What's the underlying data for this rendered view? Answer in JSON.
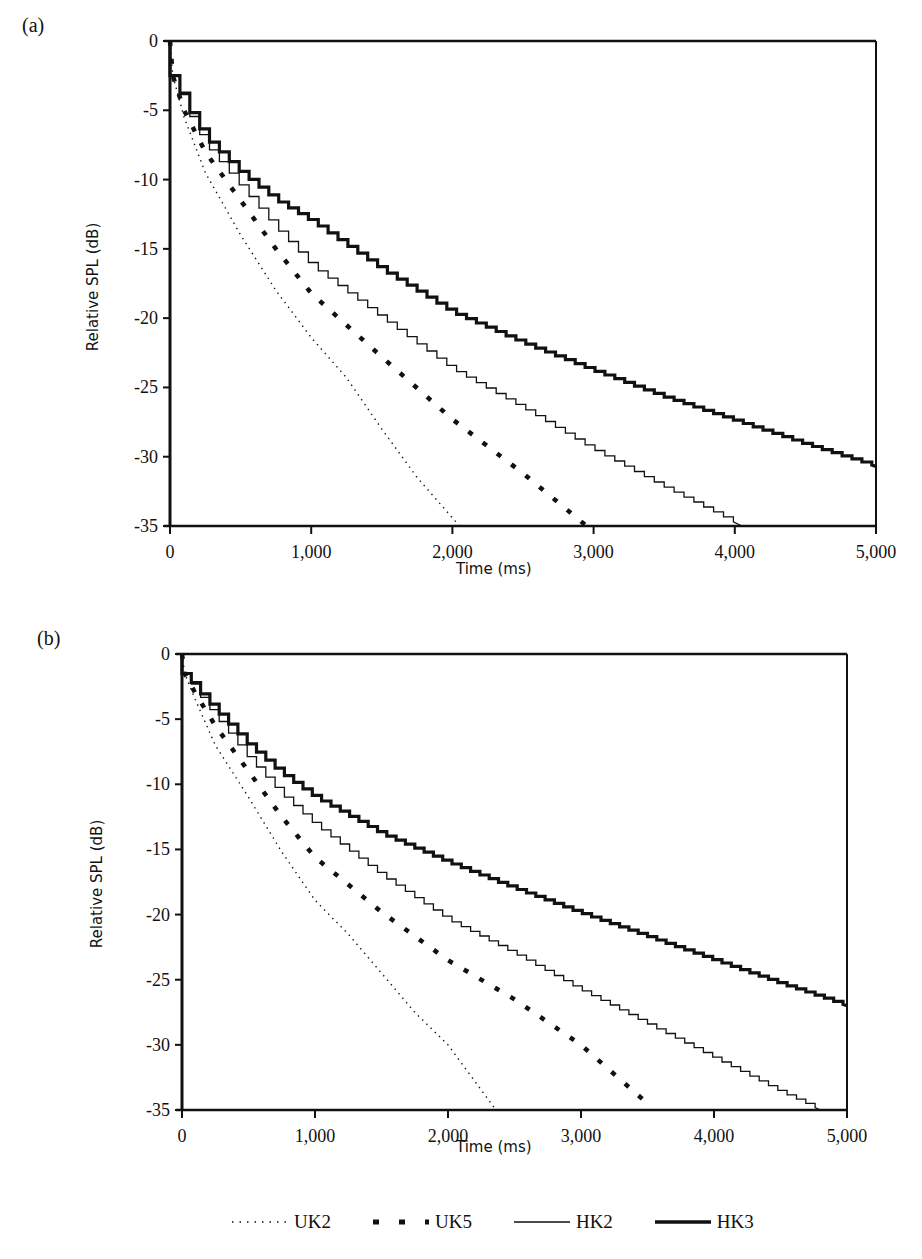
{
  "chart_data": [
    {
      "panel": "(a)",
      "type": "line",
      "title": "",
      "xlabel": "Time (ms)",
      "ylabel": "Relative SPL (dB)",
      "xlim": [
        0,
        5000
      ],
      "ylim": [
        -35,
        0
      ],
      "xticks": [
        0,
        1000,
        2000,
        3000,
        4000,
        5000
      ],
      "xtick_labels": [
        "0",
        "1,000",
        "2,000",
        "3,000",
        "4,000",
        "5,000"
      ],
      "yticks": [
        0,
        -5,
        -10,
        -15,
        -20,
        -25,
        -30,
        -35
      ],
      "ytick_labels": [
        "0",
        "-5",
        "-10",
        "-15",
        "-20",
        "-25",
        "-30",
        "-35"
      ],
      "grid": false,
      "series": [
        {
          "name": "UK2",
          "style": "dotted",
          "x": [
            0,
            20,
            100,
            250,
            500,
            750,
            1000,
            1250,
            1500,
            1750,
            2050
          ],
          "y": [
            0,
            -2.5,
            -5.5,
            -9.5,
            -14.0,
            -18.0,
            -21.4,
            -24.3,
            -28.0,
            -31.5,
            -35.0
          ]
        },
        {
          "name": "UK5",
          "style": "dashed-thick",
          "x": [
            0,
            20,
            100,
            250,
            500,
            750,
            1000,
            1500,
            2000,
            2500,
            2950
          ],
          "y": [
            0,
            -2.5,
            -5.0,
            -8.0,
            -11.5,
            -15.0,
            -18.2,
            -22.8,
            -27.3,
            -31.2,
            -35.0
          ]
        },
        {
          "name": "HK2",
          "style": "solid-thin",
          "x": [
            0,
            20,
            100,
            250,
            500,
            750,
            1000,
            1500,
            2000,
            2500,
            3000,
            3500,
            4050
          ],
          "y": [
            0,
            -2.5,
            -4.7,
            -7.5,
            -10.5,
            -13.5,
            -16.2,
            -20.0,
            -23.7,
            -26.5,
            -29.5,
            -32.2,
            -35.0
          ]
        },
        {
          "name": "HK3",
          "style": "solid-thick",
          "x": [
            0,
            20,
            100,
            250,
            500,
            750,
            1000,
            1500,
            2000,
            2500,
            3000,
            3500,
            4000,
            4500,
            5000
          ],
          "y": [
            0,
            -2.5,
            -4.5,
            -7.0,
            -9.5,
            -11.5,
            -13.0,
            -16.5,
            -19.6,
            -21.8,
            -23.8,
            -25.7,
            -27.4,
            -29.1,
            -30.7
          ]
        }
      ]
    },
    {
      "panel": "(b)",
      "type": "line",
      "title": "",
      "xlabel": "Time (ms)",
      "ylabel": "Relative SPL (dB)",
      "xlim": [
        0,
        5000
      ],
      "ylim": [
        -35,
        0
      ],
      "xticks": [
        0,
        1000,
        2000,
        3000,
        4000,
        5000
      ],
      "xtick_labels": [
        "0",
        "1,000",
        "2,000",
        "3,000",
        "4,000",
        "5,000"
      ],
      "yticks": [
        0,
        -5,
        -10,
        -15,
        -20,
        -25,
        -30,
        -35
      ],
      "ytick_labels": [
        "0",
        "-5",
        "-10",
        "-15",
        "-20",
        "-25",
        "-30",
        "-35"
      ],
      "grid": false,
      "series": [
        {
          "name": "UK2",
          "style": "dotted",
          "x": [
            0,
            20,
            100,
            250,
            500,
            750,
            1000,
            1250,
            1500,
            1750,
            2000,
            2360
          ],
          "y": [
            0,
            -1.5,
            -3.5,
            -7.0,
            -11.0,
            -15.2,
            -18.9,
            -21.5,
            -24.5,
            -27.5,
            -30.0,
            -35.0
          ]
        },
        {
          "name": "UK5",
          "style": "dashed-thick",
          "x": [
            0,
            20,
            100,
            250,
            500,
            750,
            1000,
            1500,
            2000,
            2500,
            3000,
            3500
          ],
          "y": [
            0,
            -1.5,
            -3.0,
            -5.5,
            -9.0,
            -12.5,
            -15.6,
            -19.8,
            -23.5,
            -26.5,
            -30.0,
            -34.5
          ]
        },
        {
          "name": "HK2",
          "style": "solid-thin",
          "x": [
            0,
            20,
            100,
            250,
            500,
            750,
            1000,
            1500,
            2000,
            2500,
            3000,
            3500,
            4000,
            4500,
            4800
          ],
          "y": [
            0,
            -1.5,
            -2.8,
            -4.8,
            -8.0,
            -10.8,
            -13.1,
            -17.0,
            -20.4,
            -23.0,
            -25.8,
            -28.4,
            -31.0,
            -33.6,
            -35.0
          ]
        },
        {
          "name": "HK3",
          "style": "solid-thick",
          "x": [
            0,
            20,
            100,
            250,
            500,
            750,
            1000,
            1500,
            2000,
            2500,
            3000,
            3500,
            4000,
            4500,
            5000
          ],
          "y": [
            0,
            -1.5,
            -2.6,
            -4.3,
            -7.0,
            -9.2,
            -11.0,
            -13.8,
            -16.0,
            -18.0,
            -19.9,
            -21.7,
            -23.5,
            -25.3,
            -27.0
          ]
        }
      ]
    }
  ],
  "panels": {
    "a": {
      "label": "(a)",
      "xlabel": "Time (ms)",
      "ylabel": "Relative SPL (dB)"
    },
    "b": {
      "label": "(b)",
      "xlabel": "Time (ms)",
      "ylabel": "Relative SPL (dB)"
    }
  },
  "legend": {
    "items": [
      {
        "label": "UK2",
        "style": "dotted"
      },
      {
        "label": "UK5",
        "style": "dashed-thick"
      },
      {
        "label": "HK2",
        "style": "solid-thin"
      },
      {
        "label": "HK3",
        "style": "solid-thick"
      }
    ]
  }
}
